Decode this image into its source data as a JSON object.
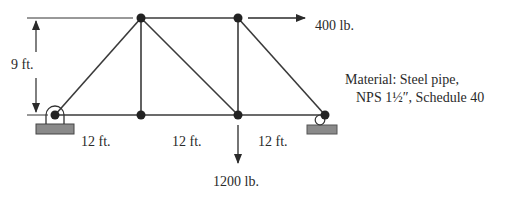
{
  "diagram": {
    "type": "truss",
    "colors": {
      "member": "#3a3a3a",
      "node": "#222222",
      "support_base": "#8a8a8a"
    },
    "height_label": "9 ft.",
    "spans": [
      "12 ft.",
      "12 ft.",
      "12 ft."
    ],
    "loads": {
      "horizontal": {
        "label": "400 lb.",
        "direction": "right"
      },
      "vertical": {
        "label": "1200 lb.",
        "direction": "down"
      }
    },
    "material": {
      "line1": "Material: Steel pipe,",
      "line2": "NPS 1½″, Schedule 40"
    },
    "supports": {
      "left": "pin-support-icon",
      "right": "roller-support-icon"
    }
  }
}
